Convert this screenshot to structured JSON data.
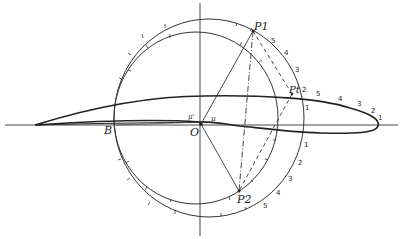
{
  "diagram": {
    "type": "conformal-mapping-airfoil",
    "points": {
      "P1": "P1",
      "P2": "P2",
      "Pt": "Pt",
      "O": "O",
      "B": "B",
      "mu": "μ",
      "mu_prime": "μ'"
    },
    "outer_circle_upper_ticks": [
      "5",
      "4",
      "3",
      "2"
    ],
    "outer_circle_lower_ticks": [
      "1",
      "2",
      "3",
      "4",
      "5"
    ],
    "airfoil_upper_ticks": [
      "1",
      "5",
      "4",
      "3",
      "2",
      "1"
    ],
    "colors": {
      "ink": "#222222",
      "background": "#ffffff"
    }
  }
}
